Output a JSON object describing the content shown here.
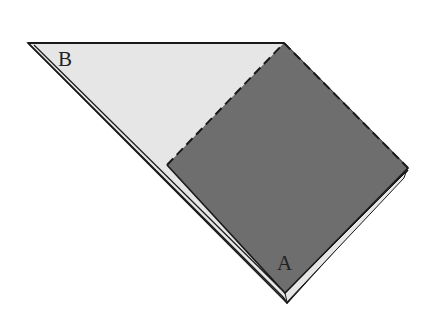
{
  "diagram": {
    "type": "paper-folding",
    "labels": {
      "a": "A",
      "b": "B"
    },
    "colors": {
      "background": "#ffffff",
      "light_paper": "#e6e6e6",
      "dark_square": "#6e6e6e",
      "edge": "#1a1a1a"
    }
  }
}
